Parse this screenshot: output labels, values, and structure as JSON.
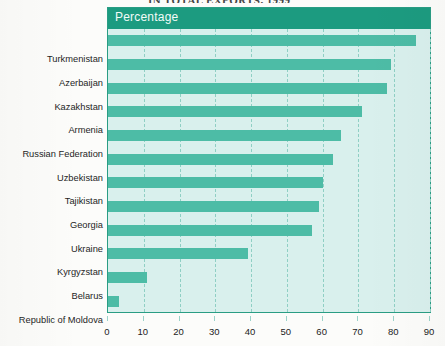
{
  "title": "IN TOTAL EXPORTS, 1999",
  "colors": {
    "header_band": "#1c9b80",
    "plot_background": "#d9f0ed",
    "bar": "#4dbca6",
    "gridline": "#8fcfc4",
    "page": "#fcfcfa"
  },
  "legend_caption": "Percentage",
  "chart_data": {
    "type": "bar",
    "orientation": "horizontal",
    "title": "IN TOTAL EXPORTS, 1999",
    "xlabel": "Percentage",
    "ylabel": "",
    "xlim": [
      0,
      90
    ],
    "xticks": [
      0,
      10,
      20,
      30,
      40,
      50,
      60,
      70,
      80,
      90
    ],
    "grid": "vertical-dashed",
    "legend": "none",
    "categories": [
      "Turkmenistan",
      "Azerbaijan",
      "Kazakhstan",
      "Armenia",
      "Russian Federation",
      "Uzbekistan",
      "Tajikistan",
      "Georgia",
      "Ukraine",
      "Kyrgyzstan",
      "Belarus",
      "Republic of Moldova"
    ],
    "values": [
      86,
      79,
      78,
      71,
      65,
      63,
      60,
      59,
      57,
      39,
      11,
      3
    ]
  }
}
